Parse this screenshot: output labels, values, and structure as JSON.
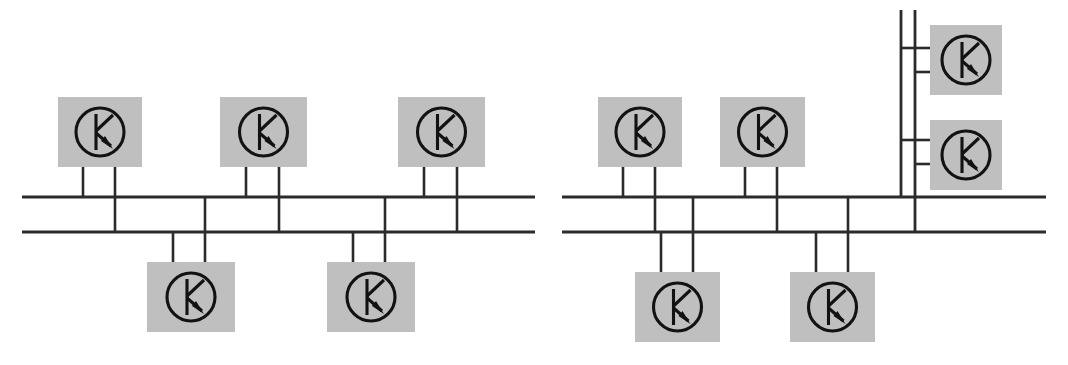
{
  "figure": {
    "background_color": "#ffffff",
    "line_color": "#2b2b2b",
    "device_fill_color": "#bfbfbf",
    "device_symbol_color": "#121212",
    "width": 1068,
    "height": 365
  },
  "symbol": {
    "name": "npn-transistor-symbol",
    "description": "circle containing vertical bar with upper diagonal lead and lower diagonal lead terminated by a filled arrowhead",
    "circle_radius": 24
  },
  "diagrams": [
    {
      "id": "left-network",
      "label": "Left bus network",
      "bus": {
        "upper_rail": {
          "x1": 22,
          "x2": 535,
          "y": 197
        },
        "lower_rail": {
          "x1": 22,
          "x2": 535,
          "y": 232
        }
      },
      "devices": [
        {
          "id": "L-T1",
          "position": "top",
          "box": {
            "x": 58,
            "y": 97,
            "w": 84,
            "h": 70
          },
          "drops": [
            {
              "x": 83,
              "y1": 167,
              "y2": 197,
              "target": "upper_rail"
            },
            {
              "x": 115,
              "y1": 167,
              "y2": 232,
              "target": "lower_rail"
            }
          ]
        },
        {
          "id": "L-T2",
          "position": "top",
          "box": {
            "x": 220,
            "y": 97,
            "w": 87,
            "h": 70
          },
          "drops": [
            {
              "x": 246,
              "y1": 167,
              "y2": 197,
              "target": "upper_rail"
            },
            {
              "x": 279,
              "y1": 167,
              "y2": 232,
              "target": "lower_rail"
            }
          ]
        },
        {
          "id": "L-T3",
          "position": "top",
          "box": {
            "x": 398,
            "y": 97,
            "w": 87,
            "h": 70
          },
          "drops": [
            {
              "x": 424,
              "y1": 167,
              "y2": 197,
              "target": "upper_rail"
            },
            {
              "x": 457,
              "y1": 167,
              "y2": 232,
              "target": "lower_rail"
            }
          ]
        },
        {
          "id": "L-B1",
          "position": "bottom",
          "box": {
            "x": 147,
            "y": 262,
            "w": 88,
            "h": 70
          },
          "drops": [
            {
              "x": 173,
              "y1": 232,
              "y2": 262,
              "target": "lower_rail"
            },
            {
              "x": 205,
              "y1": 197,
              "y2": 262,
              "target": "upper_rail"
            }
          ]
        },
        {
          "id": "L-B2",
          "position": "bottom",
          "box": {
            "x": 327,
            "y": 262,
            "w": 88,
            "h": 70
          },
          "drops": [
            {
              "x": 353,
              "y1": 232,
              "y2": 262,
              "target": "lower_rail"
            },
            {
              "x": 385,
              "y1": 197,
              "y2": 262,
              "target": "upper_rail"
            }
          ]
        }
      ],
      "riser": null
    },
    {
      "id": "right-network",
      "label": "Right bus network with vertical riser",
      "bus": {
        "upper_rail": {
          "x1": 562,
          "x2": 1046,
          "y": 197
        },
        "lower_rail": {
          "x1": 562,
          "x2": 1046,
          "y": 232
        }
      },
      "devices": [
        {
          "id": "R-T1",
          "position": "top",
          "box": {
            "x": 598,
            "y": 97,
            "w": 84,
            "h": 70
          },
          "drops": [
            {
              "x": 623,
              "y1": 167,
              "y2": 197,
              "target": "upper_rail"
            },
            {
              "x": 655,
              "y1": 167,
              "y2": 232,
              "target": "lower_rail"
            }
          ]
        },
        {
          "id": "R-T2",
          "position": "top",
          "box": {
            "x": 720,
            "y": 97,
            "w": 85,
            "h": 70
          },
          "drops": [
            {
              "x": 745,
              "y1": 167,
              "y2": 197,
              "target": "upper_rail"
            },
            {
              "x": 777,
              "y1": 167,
              "y2": 232,
              "target": "lower_rail"
            }
          ]
        },
        {
          "id": "R-B1",
          "position": "bottom",
          "box": {
            "x": 635,
            "y": 272,
            "w": 85,
            "h": 70
          },
          "drops": [
            {
              "x": 661,
              "y1": 232,
              "y2": 272,
              "target": "lower_rail"
            },
            {
              "x": 693,
              "y1": 197,
              "y2": 272,
              "target": "upper_rail"
            }
          ]
        },
        {
          "id": "R-B2",
          "position": "bottom",
          "box": {
            "x": 790,
            "y": 272,
            "w": 85,
            "h": 70
          },
          "drops": [
            {
              "x": 816,
              "y1": 232,
              "y2": 272,
              "target": "lower_rail"
            },
            {
              "x": 848,
              "y1": 197,
              "y2": 272,
              "target": "upper_rail"
            }
          ]
        },
        {
          "id": "R-S1",
          "position": "riser-upper",
          "box": {
            "x": 930,
            "y": 25,
            "w": 72,
            "h": 70
          },
          "stubs": [
            {
              "x1": 901,
              "x2": 930,
              "y": 48,
              "source": "riser_left"
            },
            {
              "x1": 915,
              "x2": 930,
              "y": 72,
              "source": "riser_right"
            }
          ]
        },
        {
          "id": "R-S2",
          "position": "riser-lower",
          "box": {
            "x": 930,
            "y": 120,
            "w": 72,
            "h": 70
          },
          "stubs": [
            {
              "x1": 901,
              "x2": 930,
              "y": 140,
              "source": "riser_left"
            },
            {
              "x1": 915,
              "x2": 930,
              "y": 164,
              "source": "riser_right"
            }
          ]
        }
      ],
      "riser": {
        "left_conductor": {
          "x": 901,
          "y1": 10,
          "y2": 197
        },
        "right_conductor": {
          "x": 915,
          "y1": 10,
          "y2": 232
        }
      }
    }
  ]
}
